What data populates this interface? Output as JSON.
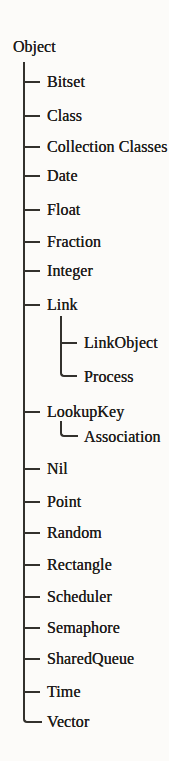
{
  "colors": {
    "ink": "#1f1d1b",
    "line": "#33312d",
    "background": "#fcfbf9"
  },
  "tree": {
    "root": "Object",
    "children": [
      {
        "label": "Bitset"
      },
      {
        "label": "Class"
      },
      {
        "label": "Collection Classes"
      },
      {
        "label": "Date"
      },
      {
        "label": "Float"
      },
      {
        "label": "Fraction"
      },
      {
        "label": "Integer"
      },
      {
        "label": "Link",
        "children": [
          {
            "label": "LinkObject"
          },
          {
            "label": "Process"
          }
        ]
      },
      {
        "label": "LookupKey",
        "children": [
          {
            "label": "Association"
          }
        ]
      },
      {
        "label": "Nil"
      },
      {
        "label": "Point"
      },
      {
        "label": "Random"
      },
      {
        "label": "Rectangle"
      },
      {
        "label": "Scheduler"
      },
      {
        "label": "Semaphore"
      },
      {
        "label": "SharedQueue"
      },
      {
        "label": "Time"
      },
      {
        "label": "Vector"
      }
    ]
  }
}
